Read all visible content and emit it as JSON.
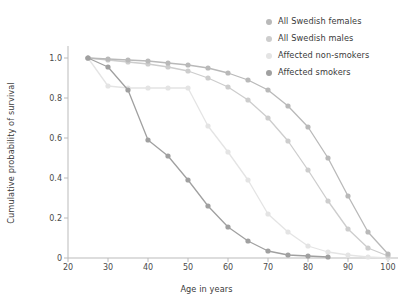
{
  "chart_data": {
    "type": "line",
    "title": "",
    "xlabel": "Age in years",
    "ylabel": "Cumulative probability of survival",
    "xlim": [
      20,
      102
    ],
    "ylim": [
      0,
      1.04
    ],
    "xticks": [
      20,
      30,
      40,
      50,
      60,
      70,
      80,
      90,
      100
    ],
    "xtick_labels": [
      "20",
      "30",
      "40",
      "50",
      "60",
      "70",
      "80",
      "90",
      "100"
    ],
    "yticks": [
      0,
      0.2,
      0.4,
      0.6,
      0.8,
      1.0
    ],
    "ytick_labels": [
      "0",
      "0.2",
      "0.4",
      "0.6",
      "0.8",
      "1.0"
    ],
    "grid": false,
    "legend_position": "top-right",
    "markers": "circle",
    "series": [
      {
        "name": "All Swedish females",
        "color": "#b9b9b9",
        "x": [
          25,
          30,
          35,
          40,
          45,
          50,
          55,
          60,
          65,
          70,
          75,
          80,
          85,
          90,
          95,
          100
        ],
        "y": [
          1.0,
          0.995,
          0.99,
          0.985,
          0.975,
          0.965,
          0.95,
          0.925,
          0.89,
          0.84,
          0.76,
          0.655,
          0.5,
          0.31,
          0.13,
          0.02
        ]
      },
      {
        "name": "All Swedish males",
        "color": "#cdcdcd",
        "x": [
          25,
          30,
          35,
          40,
          45,
          50,
          55,
          60,
          65,
          70,
          75,
          80,
          85,
          90,
          95,
          100
        ],
        "y": [
          1.0,
          0.99,
          0.98,
          0.97,
          0.955,
          0.935,
          0.9,
          0.855,
          0.79,
          0.7,
          0.585,
          0.44,
          0.285,
          0.145,
          0.05,
          0.01
        ]
      },
      {
        "name": "Affected non-smokers",
        "color": "#e4e4e4",
        "x": [
          25,
          30,
          35,
          40,
          45,
          50,
          55,
          60,
          65,
          70,
          75,
          80,
          85,
          90,
          95,
          100
        ],
        "y": [
          1.0,
          0.86,
          0.85,
          0.85,
          0.85,
          0.85,
          0.66,
          0.53,
          0.39,
          0.22,
          0.13,
          0.06,
          0.03,
          0.015,
          0.005,
          0.0
        ]
      },
      {
        "name": "Affected smokers",
        "color": "#a0a0a0",
        "x": [
          25,
          30,
          35,
          40,
          45,
          50,
          55,
          60,
          65,
          70,
          75,
          80,
          85
        ],
        "y": [
          1.0,
          0.955,
          0.84,
          0.59,
          0.51,
          0.39,
          0.26,
          0.155,
          0.085,
          0.035,
          0.015,
          0.01,
          0.005
        ]
      }
    ]
  },
  "legend": {
    "items": [
      {
        "label": "All Swedish females"
      },
      {
        "label": "All Swedish males"
      },
      {
        "label": "Affected non-smokers"
      },
      {
        "label": "Affected smokers"
      }
    ]
  }
}
